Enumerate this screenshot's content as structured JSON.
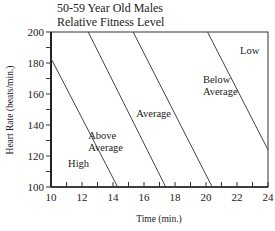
{
  "chart_data": {
    "type": "line",
    "title": "50-59 Year Old Males",
    "subtitle": "Relative Fitness Level",
    "xlabel": "Time (min.)",
    "ylabel": "Heart Rate (beats/min.)",
    "xlim": [
      10,
      24
    ],
    "ylim": [
      100,
      200
    ],
    "xticks": [
      10,
      12,
      14,
      16,
      18,
      20,
      22,
      24
    ],
    "yticks": [
      100,
      120,
      140,
      160,
      180,
      200
    ],
    "grid": false,
    "series": [
      {
        "name": "High / Above Average boundary",
        "points": [
          [
            10,
            183
          ],
          [
            14.3,
            100
          ]
        ]
      },
      {
        "name": "Above Average / Average boundary",
        "points": [
          [
            12.4,
            200
          ],
          [
            17.4,
            100
          ]
        ]
      },
      {
        "name": "Average / Below Average boundary",
        "points": [
          [
            15.3,
            200
          ],
          [
            20.4,
            100
          ]
        ]
      },
      {
        "name": "Below Average / Low boundary",
        "points": [
          [
            20.1,
            200
          ],
          [
            24,
            124
          ]
        ]
      }
    ],
    "region_labels": [
      {
        "text": [
          "High"
        ],
        "x": 11.1,
        "y": 113
      },
      {
        "text": [
          "Above",
          "Average"
        ],
        "x": 12.4,
        "y": 131
      },
      {
        "text": [
          "Average"
        ],
        "x": 15.5,
        "y": 145
      },
      {
        "text": [
          "Below",
          "Average"
        ],
        "x": 19.8,
        "y": 167
      },
      {
        "text": [
          "Low"
        ],
        "x": 22.2,
        "y": 186
      }
    ]
  }
}
